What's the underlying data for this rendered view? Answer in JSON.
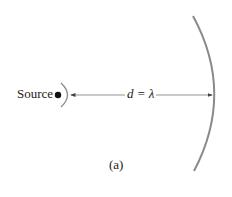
{
  "diagram": {
    "source_label": "Source",
    "distance_label": "d = λ",
    "caption": "(a)",
    "colors": {
      "mirror": "#8a8a8a",
      "wavefront": "#8a8a8a",
      "arrow": "#666666",
      "source_dot": "#111111",
      "text": "#222222"
    },
    "elements": [
      {
        "name": "point-source",
        "type": "dot"
      },
      {
        "name": "wavefront",
        "type": "arc"
      },
      {
        "name": "distance-arrow",
        "type": "double-arrow"
      },
      {
        "name": "curved-mirror",
        "type": "arc"
      }
    ]
  }
}
